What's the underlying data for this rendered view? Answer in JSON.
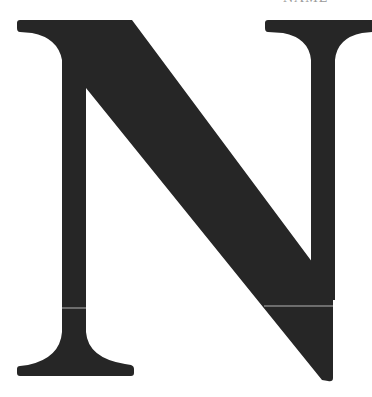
{
  "image": {
    "glyph": "N",
    "description": "Large serif capital letter N",
    "glyph_color": "#262626",
    "background_color": "#ffffff",
    "hairline_color": "#d8d8d8"
  },
  "top_fragment": {
    "text": "NAME"
  }
}
